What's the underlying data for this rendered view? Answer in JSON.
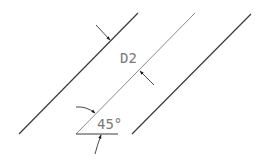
{
  "drawing": {
    "colors": {
      "background": "#ffffff",
      "outline": "#3a3a3a",
      "centerline": "#8a8a8a",
      "dimension": "#1a1a1a",
      "text": "#7a7a7a"
    },
    "lines": [
      {
        "name": "left-parallel-line",
        "x1": 19,
        "y1": 134,
        "x2": 138,
        "y2": 13
      },
      {
        "name": "middle-parallel-line",
        "x1": 76,
        "y1": 134,
        "x2": 195,
        "y2": 13
      },
      {
        "name": "right-parallel-line",
        "x1": 132,
        "y1": 134,
        "x2": 251,
        "y2": 14
      }
    ],
    "baseline": {
      "x1": 76,
      "y1": 134,
      "x2": 118,
      "y2": 134
    },
    "dimension_distance": {
      "label": "D2",
      "x": 120,
      "y": 63
    },
    "dimension_angle": {
      "label": "45°",
      "x": 97,
      "y": 129
    }
  }
}
